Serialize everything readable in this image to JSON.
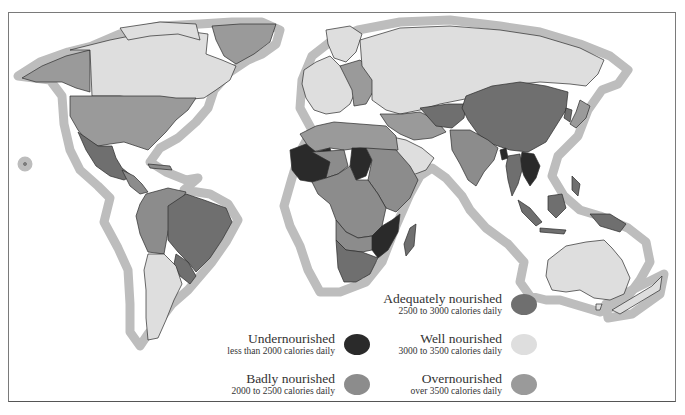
{
  "map": {
    "type": "world choropleth",
    "subject": "Daily calorie intake by country",
    "halo_color": "#bdbdbd",
    "frame_color": "#7a7a7a"
  },
  "legend": {
    "items": [
      {
        "key": "undernourished",
        "title": "Undernourished",
        "range": "less than 2000 calories daily",
        "color": "#2a2a2a"
      },
      {
        "key": "badly",
        "title": "Badly nourished",
        "range": "2000  to 2500 calories daily",
        "color": "#8c8c8c"
      },
      {
        "key": "adequately",
        "title": "Adequately nourished",
        "range": "2500 to 3000 calories daily",
        "color": "#6f6f6f"
      },
      {
        "key": "well",
        "title": "Well nourished",
        "range": "3000 to 3500 calories daily",
        "color": "#dedede"
      },
      {
        "key": "over",
        "title": "Overnourished",
        "range": "over 3500 calories daily",
        "color": "#9a9a9a"
      }
    ]
  },
  "regions": {
    "canada": "well",
    "alaska": "over",
    "usa": "over",
    "greenland": "over",
    "mexico": "adequately",
    "central_america": "badly",
    "brazil": "adequately",
    "andean_states": "badly",
    "argentina": "well",
    "paraguay_uruguay": "adequately",
    "western_europe": "well",
    "russia": "well",
    "china": "adequately",
    "india": "badly",
    "middle_east": "over",
    "saudi_arabia": "well",
    "north_africa": "over",
    "sahel_west_africa": "undernourished",
    "chad": "undernourished",
    "central_africa": "badly",
    "mozambique_zimbabwe": "undernourished",
    "south_africa": "adequately",
    "madagascar": "adequately",
    "indochina": "undernourished",
    "southeast_asia": "adequately",
    "japan": "over",
    "australia": "well",
    "new_zealand": "well",
    "papua_new_guinea": "adequately"
  }
}
